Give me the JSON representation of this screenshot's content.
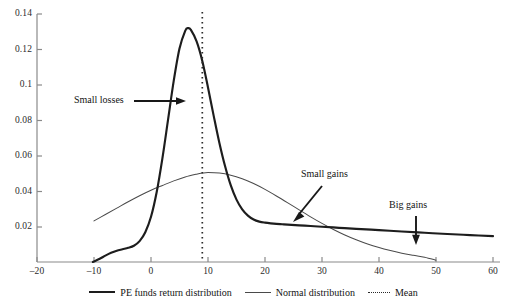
{
  "chart_data": {
    "type": "line",
    "title": "",
    "subtitle": "",
    "xlabel": "",
    "ylabel": "",
    "xlim": [
      -20,
      60
    ],
    "ylim": [
      0,
      0.14
    ],
    "grid": false,
    "legend_position": "bottom",
    "x_ticks": [
      -20,
      -10,
      0,
      10,
      20,
      30,
      40,
      50,
      60
    ],
    "x_tick_labels": [
      "–20",
      "–10",
      "0",
      "10",
      "20",
      "30",
      "40",
      "50",
      "60"
    ],
    "y_ticks": [
      0.02,
      0.04,
      0.06,
      0.08,
      0.1,
      0.12,
      0.14
    ],
    "y_tick_labels": [
      "0.02",
      "0.04",
      "0.06",
      "0.08",
      "0.1",
      "0.12",
      "0.14"
    ],
    "series": [
      {
        "name": "PE funds return distribution",
        "style": "solid-thick",
        "color": "#1d1d1d",
        "x": [
          -10.2,
          -9,
          -8,
          -7,
          -6,
          -5,
          -4,
          -3,
          -2,
          -1,
          0,
          1,
          2,
          3,
          4,
          5,
          6,
          6.5,
          7,
          8,
          9,
          10,
          11,
          12,
          13,
          14,
          15,
          16,
          17,
          18,
          19,
          20,
          21,
          22,
          23,
          24,
          26,
          28,
          30,
          33,
          36,
          40,
          44,
          48,
          52,
          56,
          60
        ],
        "y": [
          0.0,
          0.0018,
          0.0036,
          0.0052,
          0.0064,
          0.0072,
          0.008,
          0.0092,
          0.0118,
          0.0168,
          0.0255,
          0.0395,
          0.0585,
          0.0805,
          0.1025,
          0.1205,
          0.1305,
          0.132,
          0.131,
          0.1245,
          0.1135,
          0.0985,
          0.0825,
          0.0672,
          0.054,
          0.0432,
          0.0352,
          0.0297,
          0.0262,
          0.024,
          0.0228,
          0.0222,
          0.0218,
          0.0215,
          0.0213,
          0.0211,
          0.0207,
          0.0203,
          0.0199,
          0.0193,
          0.0187,
          0.018,
          0.0172,
          0.0165,
          0.0158,
          0.0152,
          0.0146
        ]
      },
      {
        "name": "Normal distribution",
        "style": "solid-thin",
        "color": "#4a4a4a",
        "x": [
          -10,
          -8,
          -6,
          -4,
          -2,
          0,
          2,
          4,
          6,
          8,
          9,
          10,
          12,
          14,
          16,
          18,
          20,
          22,
          24,
          26,
          28,
          30,
          32,
          34,
          36,
          38,
          40,
          42,
          44,
          46,
          48,
          50
        ],
        "y": [
          0.0232,
          0.0268,
          0.0304,
          0.034,
          0.0374,
          0.0405,
          0.0432,
          0.0458,
          0.048,
          0.0496,
          0.0502,
          0.0505,
          0.0502,
          0.049,
          0.047,
          0.0443,
          0.041,
          0.0373,
          0.0334,
          0.0294,
          0.0255,
          0.0218,
          0.0184,
          0.0153,
          0.0126,
          0.0102,
          0.0082,
          0.0065,
          0.005,
          0.0038,
          0.0027,
          0.001
        ]
      }
    ],
    "reference_lines": [
      {
        "name": "Mean",
        "orientation": "vertical",
        "value": 9,
        "style": "dotted",
        "color": "#2a2a2a"
      }
    ],
    "annotations": [
      {
        "label": "Small losses",
        "arrow": "right",
        "points_to_x": 5.5,
        "points_to_y": 0.088
      },
      {
        "label": "Small gains",
        "arrow": "down-left",
        "points_to_x": 23,
        "points_to_y": 0.022
      },
      {
        "label": "Big gains",
        "arrow": "down",
        "points_to_x": 46,
        "points_to_y": 0.017
      }
    ]
  },
  "legend": {
    "items": [
      {
        "label": "PE funds return distribution",
        "marker": "thick-line"
      },
      {
        "label": "Normal distribution",
        "marker": "thin-line"
      },
      {
        "label": "Mean",
        "marker": "dotted-line"
      }
    ]
  },
  "annotations": {
    "small_losses": "Small losses",
    "small_gains": "Small gains",
    "big_gains": "Big gains"
  },
  "axes": {
    "y_labels": [
      "0.14",
      "0.12",
      "0.1",
      "0.08",
      "0.06",
      "0.04",
      "0.02"
    ],
    "x_labels": [
      "–20",
      "–10",
      "0",
      "10",
      "20",
      "30",
      "40",
      "50",
      "60"
    ]
  }
}
